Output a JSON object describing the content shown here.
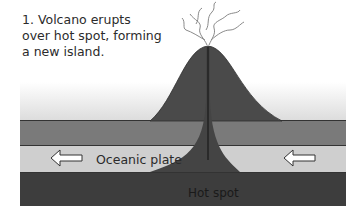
{
  "caption": "1. Volcano erupts over hot spot, forming a new island.",
  "labels": {
    "plate": "Oceanic plate",
    "hotspot": "Hot spot"
  },
  "arrows": [
    {
      "name": "left-arrow",
      "direction": "left",
      "meaning": "plate motion"
    },
    {
      "name": "right-arrow",
      "direction": "left",
      "meaning": "plate motion"
    }
  ],
  "colors": {
    "volcano": "#4a4a4a",
    "upper_band": "#7a7a7a",
    "plate_band": "#cfcfcf",
    "mantle": "#3d3d3d",
    "sky_gradient_top": "#ffffff",
    "sky_gradient_bottom": "#dedede"
  }
}
